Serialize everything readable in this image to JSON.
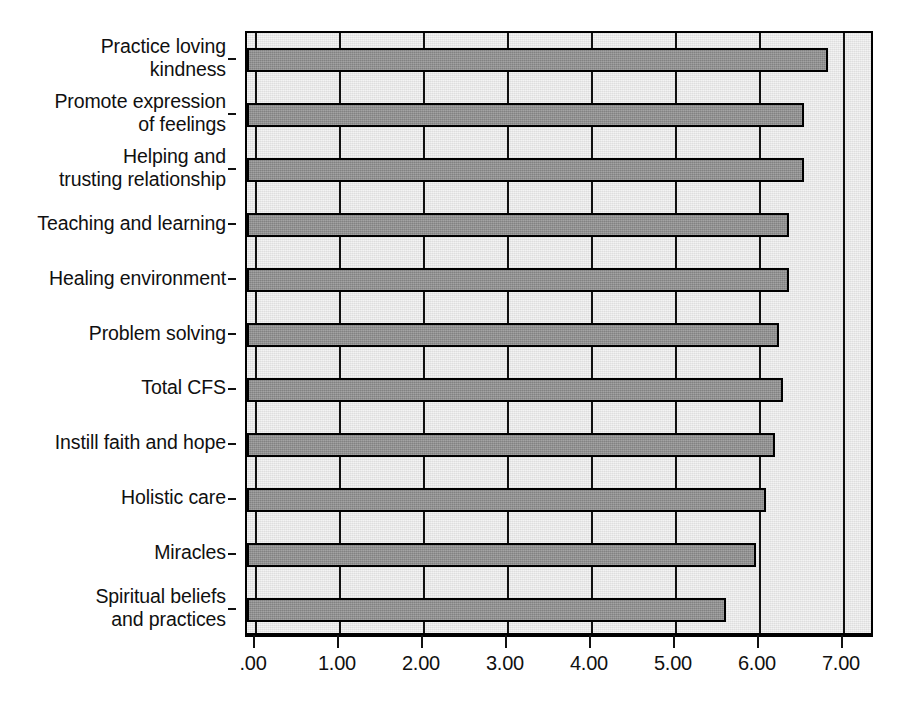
{
  "chart_data": {
    "type": "bar",
    "orientation": "horizontal",
    "title": "",
    "subtitle": "",
    "xlabel": "",
    "ylabel": "",
    "xlim": [
      0,
      7.3
    ],
    "grid": true,
    "legend": false,
    "legend_position": "none",
    "xticks": [
      ".00",
      "1.00",
      "2.00",
      "3.00",
      "4.00",
      "5.00",
      "6.00",
      "7.00"
    ],
    "xtick_values": [
      0,
      1,
      2,
      3,
      4,
      5,
      6,
      7
    ],
    "bar_color": "#8f8f8f",
    "bar_edge_color": "#000000",
    "plot_background": "#e6e6e6",
    "categories": [
      "Practice loving\nkindness",
      "Promote expression\nof feelings",
      "Helping and\ntrusting relationship",
      "Teaching and learning",
      "Healing environment",
      "Problem solving",
      "Total CFS",
      "Instill faith and hope",
      "Holistic care",
      "Miracles",
      "Spiritual beliefs\nand practices"
    ],
    "values": [
      6.82,
      6.54,
      6.54,
      6.36,
      6.36,
      6.24,
      6.29,
      6.19,
      6.08,
      5.96,
      5.61
    ]
  }
}
